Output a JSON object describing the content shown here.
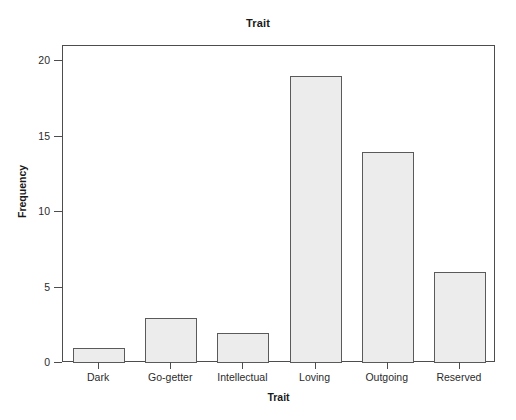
{
  "chart_data": {
    "type": "bar",
    "title": "Trait",
    "xlabel": "Trait",
    "ylabel": "Frequency",
    "categories": [
      "Dark",
      "Go-getter",
      "Intellectual",
      "Loving",
      "Outgoing",
      "Reserved"
    ],
    "values": [
      1,
      3,
      2,
      19,
      14,
      6
    ],
    "ylim": [
      0,
      21
    ],
    "yticks": [
      0,
      5,
      10,
      15,
      20
    ],
    "ytick_labels": [
      "0",
      "5",
      "10",
      "15",
      "20"
    ],
    "grid": false,
    "legend": false,
    "legend_position": "none",
    "bar_fill_color": "#ececec",
    "bar_border_color": "#5a5a5a",
    "axis_color": "#4d4d4d",
    "background_color": "#ffffff"
  }
}
